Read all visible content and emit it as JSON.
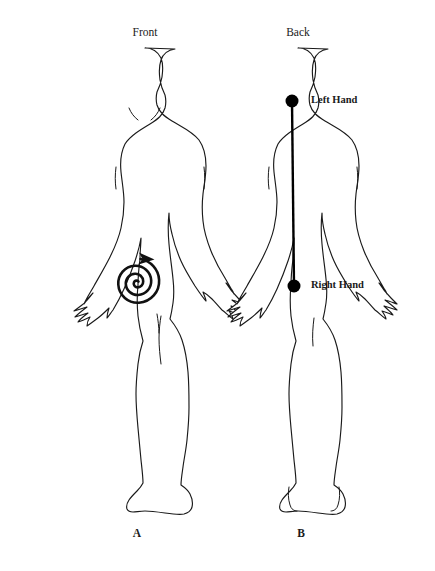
{
  "figure": {
    "background_color": "#ffffff",
    "ink_color": "#1a1a1a",
    "marker_color": "#000000",
    "view_labels": {
      "front": "Front",
      "back": "Back"
    },
    "panel_labels": {
      "left": "A",
      "right": "B"
    },
    "annotations": {
      "left_hand": "Left Hand",
      "right_hand": "Right Hand"
    },
    "markers": [
      {
        "name": "left-hand-node",
        "label": "Left Hand",
        "x": 292,
        "y": 101,
        "radius": 6.5
      },
      {
        "name": "right-hand-node",
        "label": "Right Hand",
        "x": 294,
        "y": 286,
        "radius": 6.5
      }
    ],
    "connector": {
      "name": "hand-to-hand-connector",
      "x1": 292,
      "y1": 101,
      "x2": 294,
      "y2": 286
    },
    "spiral": {
      "name": "abdominal-spiral",
      "center_x": 137,
      "center_y": 281,
      "direction": "counterclockwise-outward",
      "arrow": "right"
    }
  }
}
